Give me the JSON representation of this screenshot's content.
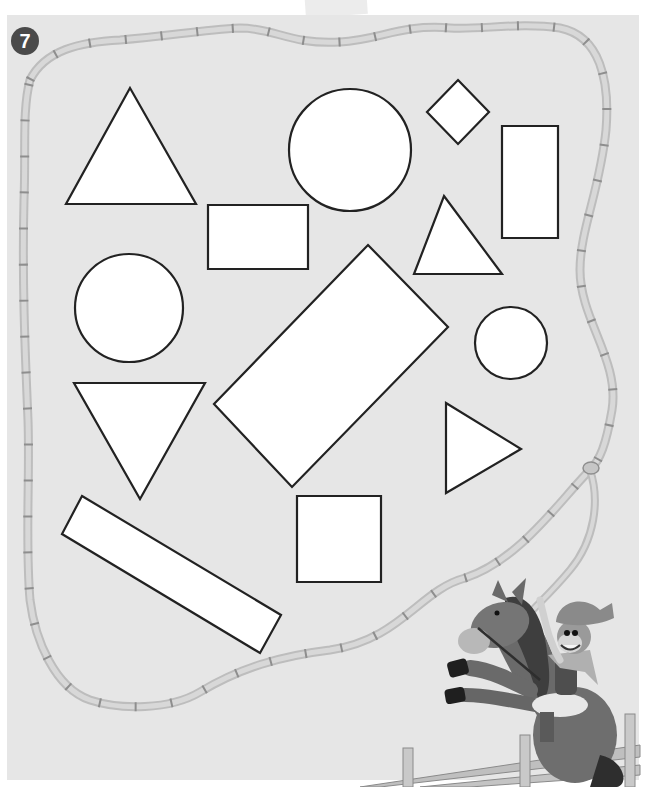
{
  "page": {
    "exercise_number": "7"
  },
  "colors": {
    "paper": "#e6e6e6",
    "shape_fill": "#ffffff",
    "shape_stroke": "#222222",
    "rope": "#cfcfcf",
    "rope_stripe": "#9a9a9a",
    "badge": "#4a4a4a"
  },
  "shapes": [
    {
      "id": "triangle-up-large",
      "type": "triangle",
      "points": "130,88 196,204 66,204"
    },
    {
      "id": "circle-large",
      "type": "circle",
      "cx": 350,
      "cy": 150,
      "r": 61
    },
    {
      "id": "diamond-small",
      "type": "diamond",
      "points": "458,80 489,112 458,144 427,112"
    },
    {
      "id": "rectangle-tall",
      "type": "rectangle",
      "points": "502,126 558,126 558,238 502,238"
    },
    {
      "id": "rectangle-wide",
      "type": "rectangle",
      "points": "208,205 308,205 308,269 208,269"
    },
    {
      "id": "triangle-up-small",
      "type": "triangle",
      "points": "444,196 502,274 414,274"
    },
    {
      "id": "circle-medium",
      "type": "circle",
      "cx": 129,
      "cy": 308,
      "r": 54
    },
    {
      "id": "rectangle-rotated-large",
      "type": "rectangle",
      "points": "368,245 448,327 292,487 214,404"
    },
    {
      "id": "circle-small",
      "type": "circle",
      "cx": 511,
      "cy": 343,
      "r": 36
    },
    {
      "id": "triangle-down",
      "type": "triangle",
      "points": "74,383 205,383 140,499"
    },
    {
      "id": "triangle-right",
      "type": "triangle",
      "points": "446,403 521,449 446,493"
    },
    {
      "id": "rectangle-long-diagonal",
      "type": "rectangle",
      "points": "82,496 281,615 260,653 62,534"
    },
    {
      "id": "square",
      "type": "square",
      "points": "297,496 381,496 381,582 297,582"
    }
  ],
  "rope": {
    "path": "M30,80 C45,50 80,42 120,40 C170,36 200,30 240,28 C275,28 290,45 340,42 C380,40 400,24 450,28 C480,30 520,22 560,28 C600,36 610,80 606,130 C600,190 580,230 580,270 C580,320 620,360 612,410 C606,445 600,460 590,470 C560,500 520,560 465,578 C420,590 400,640 330,650 C280,656 240,668 200,692 C170,710 120,710 90,700 C55,688 35,640 30,600 C25,540 30,480 28,420 C25,350 22,280 24,200 C26,150 22,110 30,80",
    "tail_path": "M590,470 C600,500 595,540 570,570 C545,600 530,610 515,630"
  },
  "illustration": {
    "characters": [
      "horse",
      "monkey-cowboy"
    ],
    "fence": true
  }
}
